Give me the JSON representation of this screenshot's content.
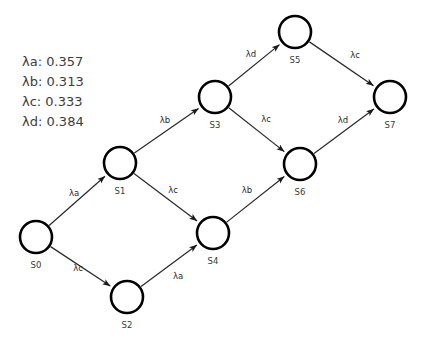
{
  "diagram": {
    "background_color": "#ffffff",
    "node_stroke_color": "#000000",
    "edge_color": "#2b2b2b",
    "label_color": "#3a3a3a",
    "node_radius": 16,
    "nodes": [
      {
        "id": "S0",
        "label": "S0",
        "cx": 36,
        "cy": 237,
        "label_x": 36,
        "label_y": 265
      },
      {
        "id": "S1",
        "label": "S1",
        "cx": 120,
        "cy": 163,
        "label_x": 120,
        "label_y": 191
      },
      {
        "id": "S2",
        "label": "S2",
        "cx": 127,
        "cy": 297,
        "label_x": 127,
        "label_y": 325
      },
      {
        "id": "S3",
        "label": "S3",
        "cx": 215,
        "cy": 97,
        "label_x": 215,
        "label_y": 125
      },
      {
        "id": "S4",
        "label": "S4",
        "cx": 213,
        "cy": 233,
        "label_x": 213,
        "label_y": 261
      },
      {
        "id": "S5",
        "label": "S5",
        "cx": 295,
        "cy": 32,
        "label_x": 295,
        "label_y": 60
      },
      {
        "id": "S6",
        "label": "S6",
        "cx": 300,
        "cy": 164,
        "label_x": 300,
        "label_y": 192
      },
      {
        "id": "S7",
        "label": "S7",
        "cx": 390,
        "cy": 97,
        "label_x": 390,
        "label_y": 125
      }
    ],
    "edges": [
      {
        "from": "S0",
        "to": "S1",
        "label": "λa",
        "label_x": 74,
        "label_y": 193
      },
      {
        "from": "S0",
        "to": "S2",
        "label": "λc",
        "label_x": 78,
        "label_y": 268
      },
      {
        "from": "S1",
        "to": "S3",
        "label": "λb",
        "label_x": 165,
        "label_y": 120
      },
      {
        "from": "S1",
        "to": "S4",
        "label": "λc",
        "label_x": 173,
        "label_y": 190
      },
      {
        "from": "S2",
        "to": "S4",
        "label": "λa",
        "label_x": 178,
        "label_y": 276
      },
      {
        "from": "S3",
        "to": "S5",
        "label": "λd",
        "label_x": 251,
        "label_y": 54
      },
      {
        "from": "S3",
        "to": "S6",
        "label": "λc",
        "label_x": 266,
        "label_y": 119
      },
      {
        "from": "S4",
        "to": "S6",
        "label": "λb",
        "label_x": 247,
        "label_y": 190
      },
      {
        "from": "S5",
        "to": "S7",
        "label": "λc",
        "label_x": 355,
        "label_y": 55
      },
      {
        "from": "S6",
        "to": "S7",
        "label": "λd",
        "label_x": 343,
        "label_y": 120
      }
    ]
  },
  "legend": {
    "x": 22,
    "y": 62,
    "line_height": 20,
    "entries": [
      {
        "text": "λa: 0.357",
        "symbol": "λa",
        "value": "0.357"
      },
      {
        "text": "λb: 0.313",
        "symbol": "λb",
        "value": "0.313"
      },
      {
        "text": "λc: 0.333",
        "symbol": "λc",
        "value": "0.333"
      },
      {
        "text": "λd: 0.384",
        "symbol": "λd",
        "value": "0.384"
      }
    ]
  }
}
